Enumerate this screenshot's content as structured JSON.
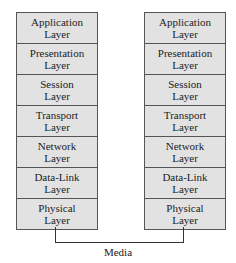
{
  "diagram": {
    "stacks": [
      {
        "name": "left",
        "layers": [
          {
            "line1": "Application",
            "line2": "Layer"
          },
          {
            "line1": "Presentation",
            "line2": "Layer"
          },
          {
            "line1": "Session",
            "line2": "Layer"
          },
          {
            "line1": "Transport",
            "line2": "Layer"
          },
          {
            "line1": "Network",
            "line2": "Layer"
          },
          {
            "line1": "Data-Link",
            "line2": "Layer"
          },
          {
            "line1": "Physical",
            "line2": "Layer"
          }
        ]
      },
      {
        "name": "right",
        "layers": [
          {
            "line1": "Application",
            "line2": "Layer"
          },
          {
            "line1": "Presentation",
            "line2": "Layer"
          },
          {
            "line1": "Session",
            "line2": "Layer"
          },
          {
            "line1": "Transport",
            "line2": "Layer"
          },
          {
            "line1": "Network",
            "line2": "Layer"
          },
          {
            "line1": "Data-Link",
            "line2": "Layer"
          },
          {
            "line1": "Physical",
            "line2": "Layer"
          }
        ]
      }
    ],
    "connection_label": "Media",
    "colors": {
      "box_fill": "#e2e2e2",
      "border": "#555555",
      "wire": "#333333"
    }
  }
}
